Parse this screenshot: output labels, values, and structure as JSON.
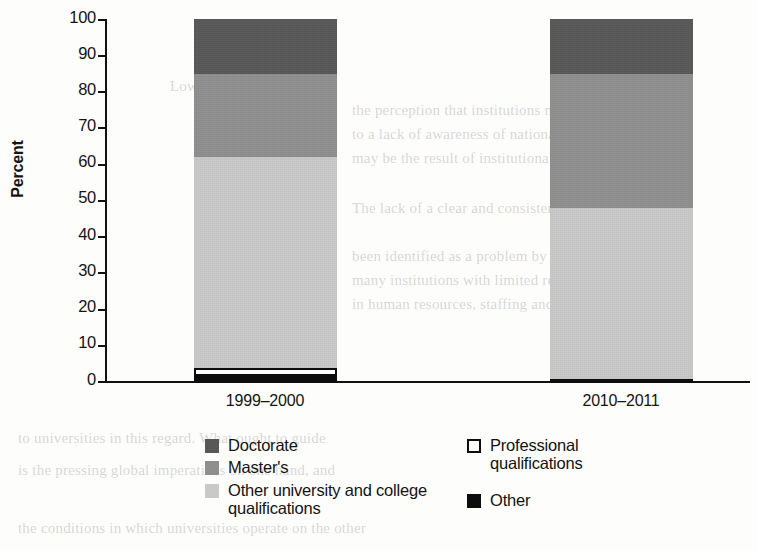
{
  "chart_data": {
    "type": "bar",
    "subtype": "stacked-100-percent",
    "title": "",
    "xlabel": "",
    "ylabel": "Percent",
    "ylim": [
      0,
      100
    ],
    "yticks": [
      0,
      10,
      20,
      30,
      40,
      50,
      60,
      70,
      80,
      90,
      100
    ],
    "ytick_labels": [
      "0",
      "10",
      "20",
      "30",
      "40",
      "50",
      "60",
      "70",
      "80",
      "90",
      "100"
    ],
    "grid": false,
    "legend_position": "below-axes",
    "categories": [
      "1999–2000",
      "2010–2011"
    ],
    "series": [
      {
        "name": "Doctorate",
        "color": "#585858",
        "values": [
          15,
          15
        ]
      },
      {
        "name": "Master's",
        "color": "#8f8f8f",
        "values": [
          23,
          37
        ]
      },
      {
        "name": "Other university and college qualifications",
        "color": "#c9c9c9",
        "values": [
          58,
          47
        ]
      },
      {
        "name": "Professional qualifications",
        "color": "#ffffff",
        "values": [
          2,
          0
        ]
      },
      {
        "name": "Other",
        "color": "#0d0d0d",
        "values": [
          2,
          1
        ]
      }
    ]
  },
  "axis": {
    "ylabel": "Percent",
    "yticks": [
      "100",
      "90",
      "80",
      "70",
      "60",
      "50",
      "40",
      "30",
      "20",
      "10",
      "0"
    ],
    "xticks": [
      "1999–2000",
      "2010–2011"
    ]
  },
  "legend": {
    "left_column": [
      {
        "label": "Doctorate",
        "swatch": "doctorate"
      },
      {
        "label": "Master's",
        "swatch": "masters"
      },
      {
        "label": "Other university and college qualifications",
        "swatch": "otheruni"
      }
    ],
    "right_column": [
      {
        "label": "Professional qualifications",
        "swatch": "professional"
      },
      {
        "label": "Other",
        "swatch": "other"
      }
    ]
  },
  "background_text": {
    "lines": [
      "Lower levels of",
      "the perception that institutions may not be",
      "to a lack of awareness of national policies",
      "may be the result of institutional",
      "The lack of a clear and consistent policy on",
      "been identified as a problem by a number of",
      "many institutions with limited resources,",
      "in human resources, staffing and finances is critical",
      "to universities in this regard. What ought to guide",
      "is the pressing global imperatives on one hand, and",
      "the conditions in which universities operate on the other"
    ]
  }
}
